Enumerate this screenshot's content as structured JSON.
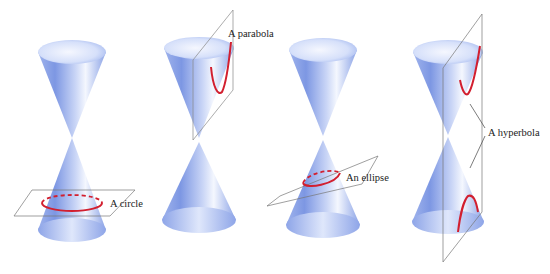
{
  "figure": {
    "panels": [
      {
        "id": "circle",
        "label": "A circle"
      },
      {
        "id": "parabola",
        "label": "A parabola"
      },
      {
        "id": "ellipse",
        "label": "An ellipse"
      },
      {
        "id": "hyperbola",
        "label": "A hyperbola"
      }
    ],
    "colors": {
      "cone": "#8fa6e6",
      "cone_light": "#eef2fd",
      "cone_dark": "#5a74cf",
      "curve": "#d21f2f",
      "plane": "#777777"
    }
  }
}
